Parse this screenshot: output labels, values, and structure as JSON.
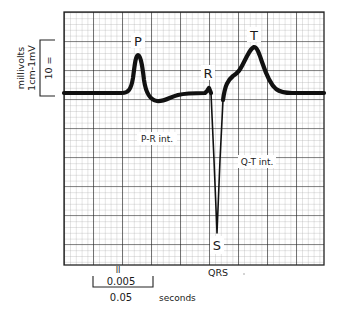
{
  "diagram": {
    "type": "ecg-trace",
    "grid": {
      "left": 64,
      "top": 12,
      "right": 324,
      "bottom": 265,
      "major_px": 29,
      "minor_px": 5.8,
      "major_color": "#222222",
      "minor_color": "#9a9a9a"
    },
    "trace": {
      "color": "#111111",
      "baseline_y": 93,
      "path": "M 64 93 L 122 93 C 128 93 131 90 133 78 C 135 62 136 55 138 55 C 140 55 142 62 144 80 C 146 94 150 100 157 101 C 164 102 170 97 178 95 C 186 93 195 93 205 93 L 207 91 L 209 88 L 211 93 L 214 160 L 217 233 L 220 160 L 223 100 C 225 85 228 80 233 76 C 238 73 240 70 244 62 C 248 54 251 48 254 47 C 257 47 259 53 262 62 C 266 74 270 84 276 89 C 280 92 285 93 292 93 L 324 93"
    },
    "wave_labels": {
      "p": "P",
      "r": "R",
      "t": "T",
      "s": "S",
      "qrs": "QRS",
      "pr_interval": "P-R int.",
      "qt_interval": "Q-T int."
    },
    "voltage_scale": {
      "title": "millivolts",
      "subtitle": "1cm-1mV",
      "inner_mark": "10 ="
    },
    "time_scale": {
      "minor": "0.005",
      "major": "0.05",
      "unit": "seconds",
      "tick_mark": "II"
    }
  }
}
